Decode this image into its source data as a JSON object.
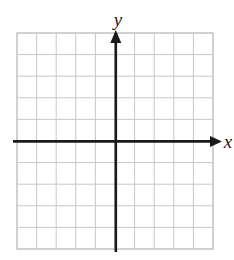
{
  "figure": {
    "name": "blank-coordinate-plane",
    "background_color": "#ffffff",
    "width": 234,
    "height": 260
  },
  "grid": {
    "columns": 10,
    "rows": 10,
    "cell_size": 19.6,
    "left": 17,
    "top": 33,
    "right": 213,
    "bottom": 249,
    "line_color": "#c8c8c8",
    "line_width": 1,
    "outer_border_color": "#bdbdbd",
    "outer_border_width": 1
  },
  "axes": {
    "color": "#1a1a1a",
    "line_width": 2.6,
    "origin_x": 115.8,
    "origin_y": 141.4,
    "x_axis": {
      "label": "x",
      "label_x": 228,
      "label_y": 148,
      "start_x": 13,
      "end_x": 219,
      "arrow": "right-arrowhead",
      "arrow_tip_x": 222
    },
    "y_axis": {
      "label": "y",
      "label_x": 118,
      "label_y": 26,
      "start_y": 252,
      "end_y": 33,
      "arrow": "up-arrowhead",
      "arrow_tip_y": 30
    }
  },
  "chart_data": {
    "type": "scatter",
    "title": "",
    "xlabel": "x",
    "ylabel": "y",
    "x": [],
    "y": [],
    "series": [],
    "xlim": [
      -5,
      5
    ],
    "ylim": [
      -5,
      5
    ],
    "xticks": [
      -5,
      -4,
      -3,
      -2,
      -1,
      0,
      1,
      2,
      3,
      4,
      5
    ],
    "yticks": [
      -5,
      -4,
      -3,
      -2,
      -1,
      0,
      1,
      2,
      3,
      4,
      5
    ],
    "tick_labels_shown": false,
    "grid": true,
    "legend": false,
    "annotations": [],
    "note": "Empty coordinate plane: 10 by 10 unit grid, axes drawn through the center with arrowheads, no plotted data points."
  }
}
